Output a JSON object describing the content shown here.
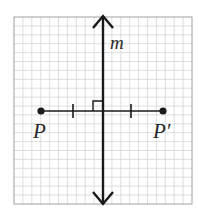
{
  "diagram": {
    "grid": {
      "x0": 14,
      "y0": 17,
      "x1": 192,
      "y1": 204,
      "cell": 8.9,
      "line_color": "#d6d6d6",
      "border_color": "#9a9a9a"
    },
    "line_m": {
      "label": "m",
      "x": 103,
      "y_top": 15,
      "y_bottom": 205,
      "color": "#1a1a1a"
    },
    "segment": {
      "y": 111,
      "x_start": 41,
      "x_end": 163,
      "color": "#1a1a1a"
    },
    "points": [
      {
        "id": "P",
        "label": "P",
        "x": 41,
        "y": 111
      },
      {
        "id": "P_prime",
        "label": "P′",
        "x": 163,
        "y": 111
      }
    ],
    "tick_marks": [
      {
        "x": 73
      },
      {
        "x": 131
      }
    ],
    "right_angle_marker": {
      "x": 93,
      "y": 101,
      "size": 10
    }
  }
}
